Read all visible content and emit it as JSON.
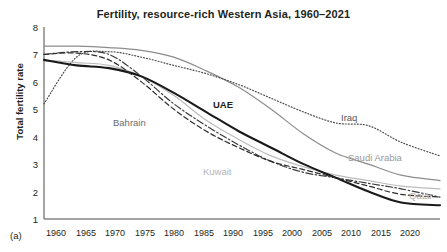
{
  "chart_data": {
    "type": "line",
    "title": "Fertility, resource-rich Western Asia, 1960–2021",
    "panel_letter": "(a)",
    "xlabel": "",
    "ylabel": "Total fertility rate",
    "xlim": [
      1960,
      2021
    ],
    "ylim": [
      1,
      8
    ],
    "grid": false,
    "legend_position": "inline-labels",
    "yticks": [
      "8",
      "7",
      "6",
      "5",
      "4",
      "3",
      "2",
      "1"
    ],
    "xticks": [
      "1960",
      "1965",
      "1970",
      "1975",
      "1980",
      "1985",
      "1990",
      "1995",
      "2000",
      "2005",
      "2010",
      "2015",
      "2020"
    ],
    "x": [
      1960,
      1965,
      1970,
      1975,
      1980,
      1985,
      1990,
      1995,
      2000,
      2005,
      2010,
      2015,
      2021
    ],
    "series": [
      {
        "name": "Saudi Arabia",
        "style": "solid",
        "color": "#8c8c8c",
        "values": [
          7.3,
          7.3,
          7.25,
          7.15,
          6.9,
          6.4,
          5.8,
          5.0,
          4.1,
          3.4,
          3.0,
          2.6,
          2.4
        ]
      },
      {
        "name": "Iraq",
        "style": "dotted",
        "color": "#4d4d4d",
        "values": [
          5.2,
          6.9,
          7.1,
          6.9,
          6.6,
          6.3,
          5.9,
          5.4,
          4.9,
          4.5,
          4.4,
          3.8,
          3.3
        ]
      },
      {
        "name": "Bahrain",
        "style": "dash-dot",
        "color": "#3a3a3a",
        "values": [
          7.0,
          7.1,
          7.0,
          6.2,
          5.2,
          4.4,
          3.7,
          3.1,
          2.7,
          2.5,
          2.3,
          2.1,
          1.8
        ]
      },
      {
        "name": "Kuwait",
        "style": "solid-light",
        "color": "#bcbcbc",
        "values": [
          6.8,
          6.7,
          6.6,
          6.2,
          5.5,
          4.6,
          3.9,
          3.3,
          2.9,
          2.6,
          2.4,
          2.2,
          2.1
        ]
      },
      {
        "name": "UAE",
        "style": "solid-bold",
        "color": "#1a1a1a",
        "values": [
          6.8,
          6.6,
          6.5,
          6.2,
          5.6,
          4.9,
          4.2,
          3.6,
          3.0,
          2.5,
          2.0,
          1.6,
          1.5
        ]
      },
      {
        "name": "Qatar",
        "style": "dashed",
        "color": "#2e2e2e",
        "values": [
          7.0,
          7.05,
          6.8,
          6.0,
          5.0,
          4.2,
          3.6,
          3.1,
          2.8,
          2.5,
          2.2,
          1.9,
          1.8
        ]
      }
    ],
    "annotations": [
      {
        "text": "UAE",
        "x": 1990,
        "y": 4.5
      },
      {
        "text": "Bahrain",
        "x": 1975,
        "y": 4.1
      },
      {
        "text": "Iraq",
        "x": 2010,
        "y": 4.4
      },
      {
        "text": "Saudi Arabia",
        "x": 2012,
        "y": 3.05
      },
      {
        "text": "Kuwait",
        "x": 1988,
        "y": 2.65
      },
      {
        "text": "Qatar",
        "x": 2020,
        "y": 1.95
      }
    ]
  }
}
